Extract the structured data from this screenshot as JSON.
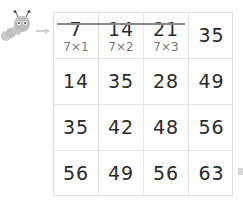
{
  "grid": {
    "rows": [
      [
        {
          "value": "7",
          "sub": "7×1"
        },
        {
          "value": "14",
          "sub": "7×2"
        },
        {
          "value": "21",
          "sub": "7×3"
        },
        {
          "value": "35"
        }
      ],
      [
        {
          "value": "14"
        },
        {
          "value": "35"
        },
        {
          "value": "28"
        },
        {
          "value": "49"
        }
      ],
      [
        {
          "value": "35"
        },
        {
          "value": "42"
        },
        {
          "value": "48"
        },
        {
          "value": "56"
        }
      ],
      [
        {
          "value": "56"
        },
        {
          "value": "49"
        },
        {
          "value": "56"
        },
        {
          "value": "63"
        }
      ]
    ]
  },
  "colors": {
    "caterpillar": "#bfbfbf",
    "arrow": "#d0d0d0",
    "strike": "#8a8a8a"
  }
}
